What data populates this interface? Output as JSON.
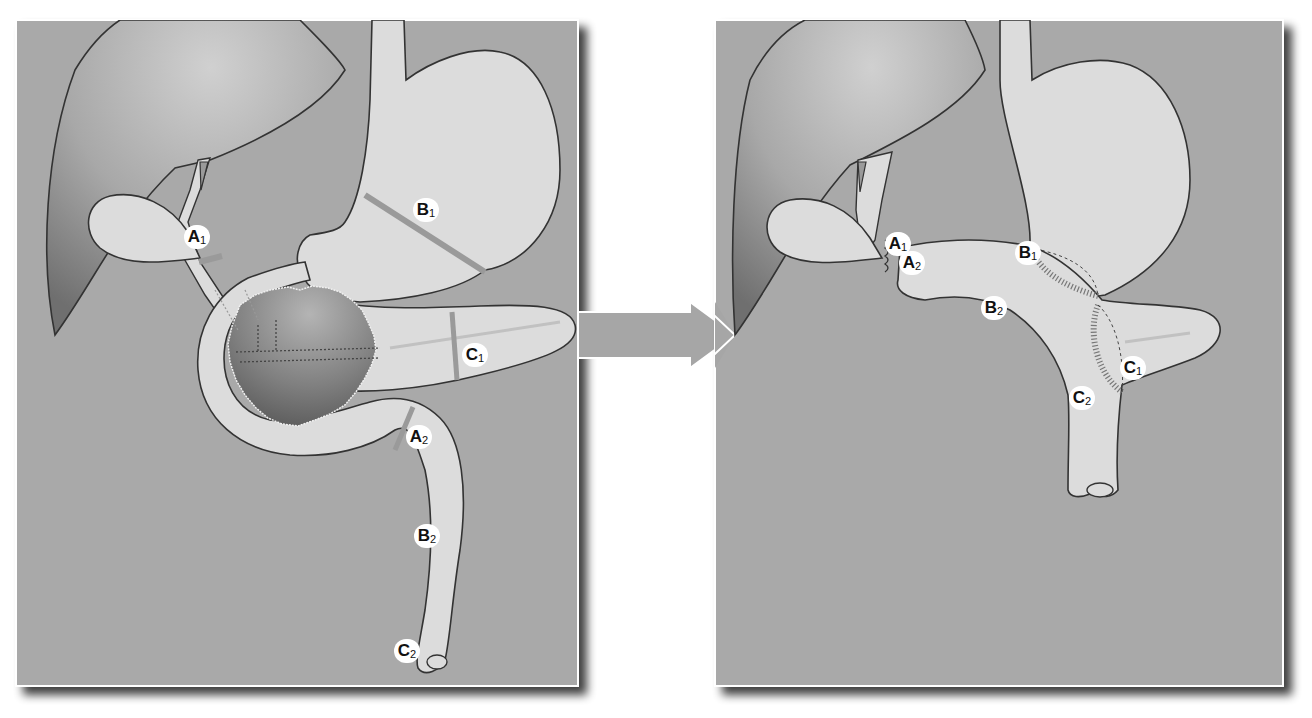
{
  "colors": {
    "background": "#ffffff",
    "panel_fill": "#a9a9a9",
    "organ_fill": "#dcdcdc",
    "liver_light": "#c4c4c4",
    "liver_dark": "#7a7a7a",
    "tumor_light": "#a0a0a0",
    "tumor_dark": "#5e5e5e",
    "outline": "#333333",
    "cut_line": "#9a9a9a",
    "suture": "#777777",
    "arrow_fill": "#a6a6a6",
    "arrow_stroke": "#ffffff",
    "label_bg": "#ffffff",
    "label_text": "#111111"
  },
  "diagram": {
    "before_panel": {
      "name": "Before resection",
      "labels": [
        {
          "id": "A1",
          "letter": "A",
          "sub": "1",
          "x": 196,
          "y": 237
        },
        {
          "id": "B1",
          "letter": "B",
          "sub": "1",
          "x": 425,
          "y": 210
        },
        {
          "id": "C1",
          "letter": "C",
          "sub": "1",
          "x": 474,
          "y": 355
        },
        {
          "id": "A2",
          "letter": "A",
          "sub": "2",
          "x": 418,
          "y": 437
        },
        {
          "id": "B2",
          "letter": "B",
          "sub": "2",
          "x": 426,
          "y": 536
        },
        {
          "id": "C2",
          "letter": "C",
          "sub": "2",
          "x": 406,
          "y": 651
        }
      ],
      "structures": [
        "liver",
        "gallbladder",
        "bile duct",
        "esophagus",
        "stomach",
        "duodenum",
        "pancreas",
        "tumor",
        "jejunum"
      ]
    },
    "arrow": {
      "direction": "right",
      "meaning": "reconstruction"
    },
    "after_panel": {
      "name": "After reconstruction",
      "labels": [
        {
          "id": "A1",
          "letter": "A",
          "sub": "1",
          "x": 897,
          "y": 244
        },
        {
          "id": "A2",
          "letter": "A",
          "sub": "2",
          "x": 911,
          "y": 263
        },
        {
          "id": "B1",
          "letter": "B",
          "sub": "1",
          "x": 1027,
          "y": 253
        },
        {
          "id": "B2",
          "letter": "B",
          "sub": "2",
          "x": 993,
          "y": 308
        },
        {
          "id": "C1",
          "letter": "C",
          "sub": "1",
          "x": 1132,
          "y": 368
        },
        {
          "id": "C2",
          "letter": "C",
          "sub": "2",
          "x": 1081,
          "y": 398
        }
      ],
      "anastomoses": [
        "hepaticojejunostomy (A1–A2)",
        "gastrojejunostomy (B1–B2)",
        "pancreaticojejunostomy (C1–C2)"
      ]
    }
  }
}
